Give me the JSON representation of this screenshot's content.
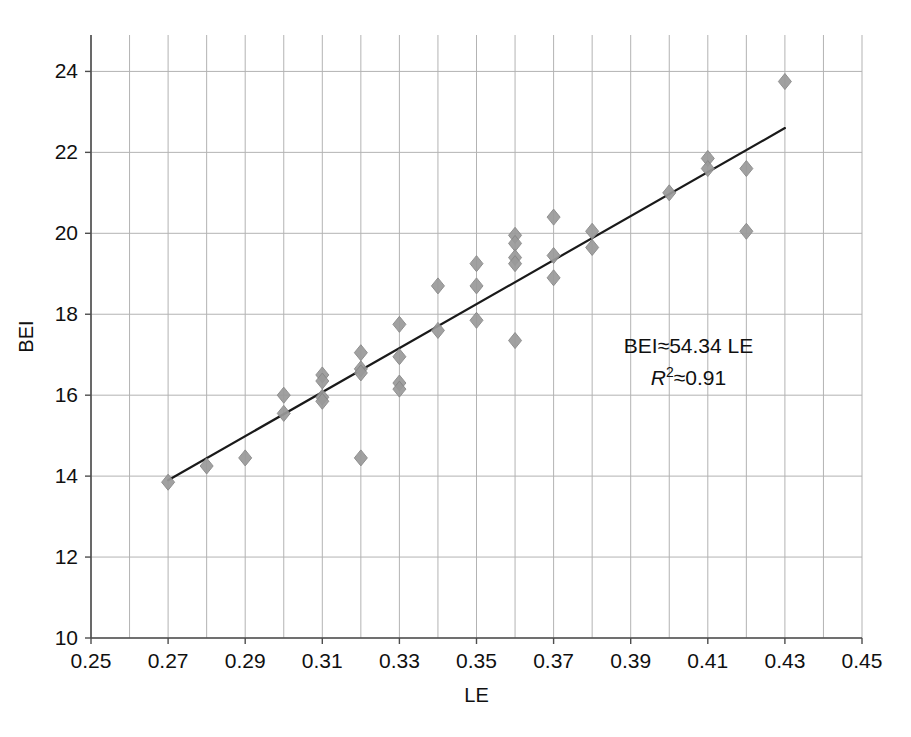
{
  "chart_data": {
    "type": "scatter",
    "title": "",
    "xlabel": "LE",
    "ylabel": "BEI",
    "xlim": [
      0.25,
      0.45
    ],
    "ylim": [
      10,
      24.9
    ],
    "x_ticks": [
      "0.25",
      "0.27",
      "0.29",
      "0.31",
      "0.33",
      "0.35",
      "0.37",
      "0.39",
      "0.41",
      "0.43",
      "0.45"
    ],
    "x_tick_values": [
      0.25,
      0.27,
      0.29,
      0.31,
      0.33,
      0.35,
      0.37,
      0.39,
      0.41,
      0.43,
      0.45
    ],
    "y_ticks": [
      "10",
      "12",
      "14",
      "16",
      "18",
      "20",
      "22",
      "24"
    ],
    "y_tick_values": [
      10,
      12,
      14,
      16,
      18,
      20,
      22,
      24
    ],
    "x_minor_step": 0.01,
    "grid": true,
    "grid_color": "#b3b3b3",
    "legend": "none",
    "marker": {
      "shape": "diamond",
      "color": "#9a9a9a",
      "edge_color": "#878787",
      "size": 13
    },
    "points": [
      {
        "x": 0.27,
        "y": 13.85
      },
      {
        "x": 0.28,
        "y": 14.25
      },
      {
        "x": 0.29,
        "y": 14.45
      },
      {
        "x": 0.3,
        "y": 16.0
      },
      {
        "x": 0.3,
        "y": 15.55
      },
      {
        "x": 0.31,
        "y": 16.5
      },
      {
        "x": 0.31,
        "y": 16.35
      },
      {
        "x": 0.31,
        "y": 15.95
      },
      {
        "x": 0.31,
        "y": 15.85
      },
      {
        "x": 0.32,
        "y": 17.05
      },
      {
        "x": 0.32,
        "y": 16.65
      },
      {
        "x": 0.32,
        "y": 16.55
      },
      {
        "x": 0.32,
        "y": 14.45
      },
      {
        "x": 0.33,
        "y": 17.75
      },
      {
        "x": 0.33,
        "y": 16.95
      },
      {
        "x": 0.33,
        "y": 16.3
      },
      {
        "x": 0.33,
        "y": 16.15
      },
      {
        "x": 0.34,
        "y": 18.7
      },
      {
        "x": 0.34,
        "y": 17.6
      },
      {
        "x": 0.35,
        "y": 19.25
      },
      {
        "x": 0.35,
        "y": 18.7
      },
      {
        "x": 0.35,
        "y": 17.85
      },
      {
        "x": 0.36,
        "y": 19.95
      },
      {
        "x": 0.36,
        "y": 19.75
      },
      {
        "x": 0.36,
        "y": 19.4
      },
      {
        "x": 0.36,
        "y": 19.25
      },
      {
        "x": 0.36,
        "y": 17.35
      },
      {
        "x": 0.37,
        "y": 20.4
      },
      {
        "x": 0.37,
        "y": 19.45
      },
      {
        "x": 0.37,
        "y": 18.9
      },
      {
        "x": 0.38,
        "y": 20.05
      },
      {
        "x": 0.38,
        "y": 19.65
      },
      {
        "x": 0.4,
        "y": 21.0
      },
      {
        "x": 0.41,
        "y": 21.85
      },
      {
        "x": 0.41,
        "y": 21.6
      },
      {
        "x": 0.42,
        "y": 21.6
      },
      {
        "x": 0.42,
        "y": 20.05
      },
      {
        "x": 0.43,
        "y": 23.75
      }
    ],
    "trendline": {
      "type": "linear",
      "x_start": 0.27,
      "y_start": 13.9,
      "x_end": 0.43,
      "y_end": 22.6,
      "color": "#1a1a1a",
      "width": 2.2
    },
    "annotations": [
      {
        "text": "BEI≈54.34 LE",
        "x": 0.405,
        "y": 17.05
      },
      {
        "text": "R",
        "superscript": "2",
        "rest": "≈0.91",
        "x": 0.405,
        "y": 16.25
      }
    ]
  },
  "annotation": {
    "equation": "BEI≈54.34 LE",
    "r_symbol": "R",
    "r_exponent": "2",
    "r_value": "≈0.91"
  },
  "axes": {
    "x_title": "LE",
    "y_title": "BEI"
  }
}
